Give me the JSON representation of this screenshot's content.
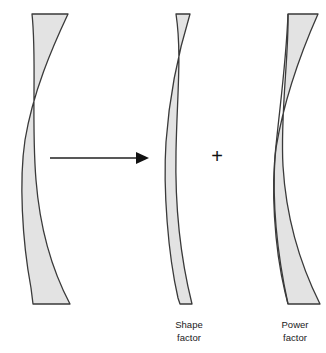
{
  "figure": {
    "title": "",
    "background_color": "#ffffff",
    "lens_fill_color": "#e3e3e3",
    "lens_stroke_color": "#3a3a3a",
    "arrow_color": "#202020",
    "text_color": "#1a1a1a",
    "plus_symbol": "+"
  },
  "elements": {
    "source_lens": {
      "name": "meniscus-lens",
      "label": ""
    },
    "arrow": {
      "name": "decomposition-arrow",
      "direction": "right",
      "label": ""
    },
    "shape_factor_lens": {
      "name": "shape-factor-lens",
      "label_line1": "Shape",
      "label_line2": "factor"
    },
    "power_factor_lens": {
      "name": "power-factor-lens",
      "label_line1": "Power",
      "label_line2": "factor"
    }
  },
  "paths": {
    "source_lens_d": "M 32 14 L 68 14 C 52 48 33 92 25 140 C 19 180 22 240 31 288 L 33 304 L 70 304 C 52 270 40 230 36 180 C 31 120 37 60 32 14 Z",
    "shape_factor_lens_d": "M 176 14 L 190 14 C 176 60 169 100 166 142 C 163 190 168 254 178 298 L 180 304 L 192 304 C 180 256 175 200 176 152 C 177 96 182 54 176 14 Z",
    "power_factor_lens_d": "M 288 14 L 318 14 C 302 50 284 100 276 148 C 271 186 274 246 285 292 L 288 304 L 320 304 C 300 264 286 216 283 166 C 280 114 289 56 288 14 Z",
    "power_factor_inner_d": "M 288 14 C 286 66 279 112 275 156 C 272 204 278 258 288 304",
    "arrow_line": {
      "x1": 50,
      "y1": 158,
      "x2": 136,
      "y2": 158
    },
    "arrow_head": "M 136 152 L 149 158 L 136 164 Z"
  },
  "layout": {
    "width": 326,
    "height": 353,
    "caption_y_line1": 328,
    "caption_y_line2": 341,
    "shape_caption_x": 189,
    "power_caption_x": 295,
    "plus_x": 217,
    "plus_y": 163
  }
}
